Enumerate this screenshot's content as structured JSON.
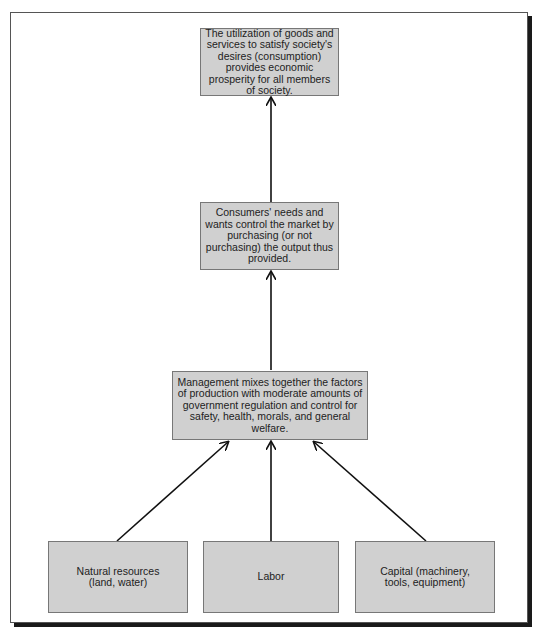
{
  "diagram": {
    "boxes": {
      "consumption": "The utilization of goods and services to satisfy society's desires (consumption) provides economic prosperity for all members of society.",
      "consumers": "Consumers' needs and wants control the market by purchasing (or not purchasing) the output thus provided.",
      "management": "Management mixes together the factors of production with moderate amounts of government regulation and control for safety, health, morals, and general welfare.",
      "natural_resources": "Natural resources (land, water)",
      "labor": "Labor",
      "capital": "Capital (machinery, tools, equipment)"
    },
    "colors": {
      "box_fill": "#d0d0d0",
      "box_border": "#777777",
      "arrow": "#111111"
    },
    "edges": [
      [
        "natural_resources",
        "management"
      ],
      [
        "labor",
        "management"
      ],
      [
        "capital",
        "management"
      ],
      [
        "management",
        "consumers"
      ],
      [
        "consumers",
        "consumption"
      ]
    ]
  }
}
